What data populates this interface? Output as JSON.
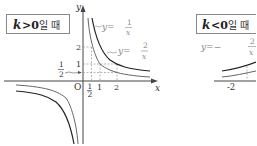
{
  "panels": [
    {
      "condition_label": "k>0일 때",
      "condition_k": "k",
      "condition_op": ">0",
      "condition_suffix": "일 때",
      "axis_labels": {
        "x": "x",
        "y": "y",
        "origin": "O"
      },
      "x_ticks": [
        "1/2",
        "1",
        "2"
      ],
      "y_ticks": [
        "1/2",
        "1",
        "2"
      ],
      "curves": [
        {
          "equation": "y=1/x",
          "lhs": "y=",
          "num": "1",
          "den": "x",
          "color": "#666666"
        },
        {
          "equation": "y=2/x",
          "lhs": "y=",
          "num": "2",
          "den": "x",
          "color": "#222222"
        }
      ]
    },
    {
      "condition_label": "k<0일 때",
      "condition_k": "k",
      "condition_op": "<0",
      "condition_suffix": "일 때",
      "x_ticks": [
        "-2"
      ],
      "curves": [
        {
          "equation": "y=-2/x",
          "lhs": "y=−",
          "num": "2",
          "den": "x",
          "color": "#222222"
        }
      ]
    }
  ],
  "colors": {
    "axis": "#444444",
    "grid_dashed": "#999999",
    "box_border": "#888888",
    "text": "#333333"
  }
}
